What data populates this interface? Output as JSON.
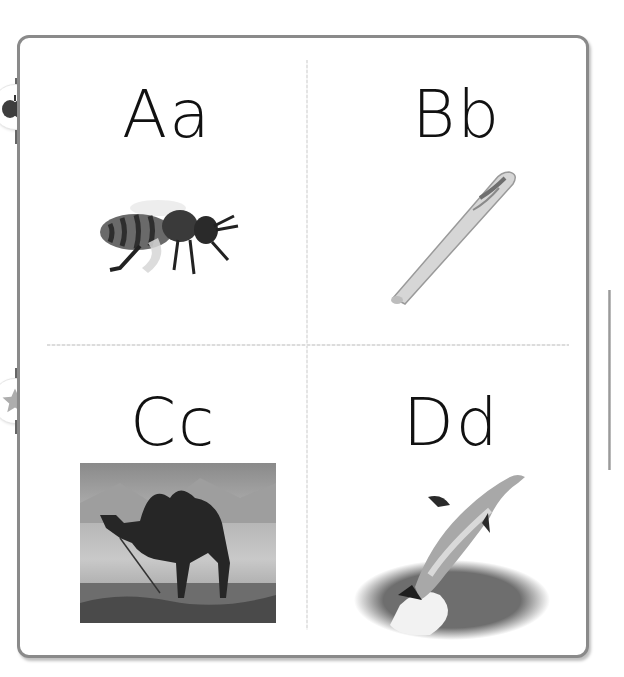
{
  "page": {
    "cells": [
      {
        "letter": "Aa",
        "picture": "bee",
        "picture_label": "bee"
      },
      {
        "letter": "Bb",
        "picture": "bat",
        "picture_label": "baseball bat"
      },
      {
        "letter": "Cc",
        "picture": "camel",
        "picture_label": "camel"
      },
      {
        "letter": "Dd",
        "picture": "dolphin",
        "picture_label": "dolphin"
      }
    ],
    "side_tabs": [
      {
        "icon": "apple-icon",
        "glyph": "🍎"
      },
      {
        "icon": "star-icon",
        "glyph": "★"
      }
    ]
  },
  "colors": {
    "border": "#8a8a8a",
    "text": "#111111",
    "divider": "#dcdcdc",
    "star": "#b0b0b0",
    "apple": "#444444"
  }
}
